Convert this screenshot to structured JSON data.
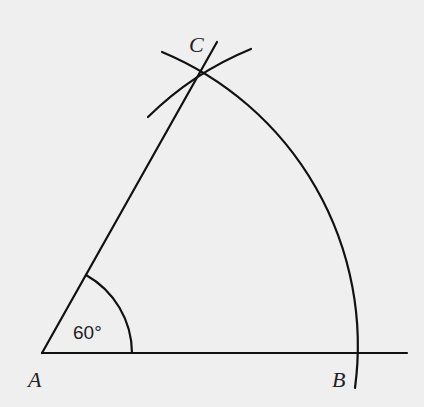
{
  "diagram": {
    "points": [
      {
        "name": "A",
        "label": "A",
        "x": 42,
        "y": 353
      },
      {
        "name": "B",
        "label": "B",
        "x": 360,
        "y": 353
      },
      {
        "name": "C",
        "label": "C",
        "x": 203,
        "y": 69
      }
    ],
    "angle_label": "60°",
    "colors": {
      "background": "#efefef",
      "ink": "#111111"
    }
  }
}
